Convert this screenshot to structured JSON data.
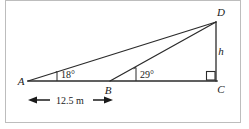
{
  "figure": {
    "type": "geometry-diagram",
    "background_color": "#ffffff",
    "stroke_color": "#2b2b2b",
    "border_color": "#b8b8b8",
    "vertices": [
      {
        "id": "A",
        "label": "A",
        "x": 28,
        "y": 81,
        "label_x": 21,
        "label_y": 84
      },
      {
        "id": "B",
        "label": "B",
        "x": 110,
        "y": 81,
        "label_x": 107,
        "label_y": 93
      },
      {
        "id": "C",
        "label": "C",
        "x": 216,
        "y": 81,
        "label_x": 219,
        "label_y": 92
      },
      {
        "id": "D",
        "label": "D",
        "x": 216,
        "y": 22,
        "label_x": 219,
        "label_y": 15
      }
    ],
    "segments": [
      {
        "name": "baseline-AC",
        "from": "A",
        "to": "C"
      },
      {
        "name": "hypotenuse-AD",
        "from": "A",
        "to": "D"
      },
      {
        "name": "hypotenuse-BD",
        "from": "B",
        "to": "D"
      },
      {
        "name": "height-DC",
        "from": "D",
        "to": "C"
      }
    ],
    "angles": [
      {
        "name": "angle-at-A",
        "label": "18°",
        "value": 18,
        "at": "A",
        "label_x": 58,
        "label_y": 77
      },
      {
        "name": "angle-at-B",
        "label": "29°",
        "value": 29,
        "at": "B",
        "label_x": 139,
        "label_y": 77
      },
      {
        "name": "right-angle-at-C",
        "label": "90°",
        "value": 90,
        "at": "C"
      }
    ],
    "height_label": {
      "name": "h",
      "label": "h",
      "x": 221,
      "y": 54
    },
    "dimension": {
      "name": "AB-distance",
      "label": "12.5 m",
      "value": 12.5,
      "unit": "m",
      "from_x": 28,
      "to_x": 112,
      "y": 100,
      "label_x": 70,
      "label_y": 104
    }
  }
}
